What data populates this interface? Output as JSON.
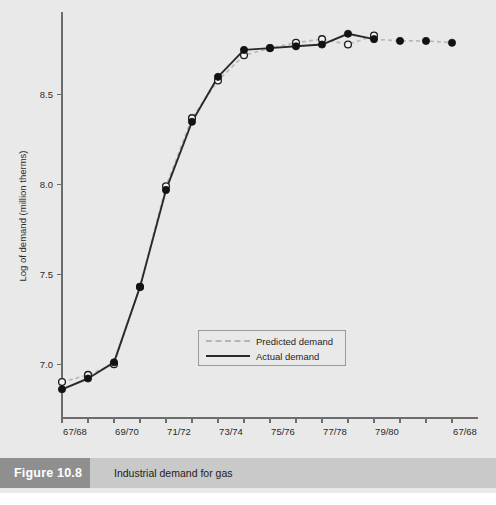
{
  "figure": {
    "number_label": "Figure 10.8",
    "caption": "Industrial demand for gas",
    "source_note": ""
  },
  "chart_data": {
    "type": "line",
    "title": "Industrial demand for gas",
    "xlabel": "",
    "ylabel": "Log of demand (million therms)",
    "grid": false,
    "legend_position": "inside-bottom-center",
    "xlim": [
      0,
      16
    ],
    "ylim": [
      6.7,
      8.95
    ],
    "y_ticks": [
      7.0,
      7.5,
      8.0,
      8.5
    ],
    "y_tick_labels": [
      "7.0",
      "7.5",
      "8.0",
      "8.5"
    ],
    "x_tick_positions": [
      0,
      1,
      2,
      3,
      4,
      5,
      6,
      7,
      8,
      9,
      10,
      11,
      12,
      13,
      14,
      15
    ],
    "x_tick_labels": [
      "67/68",
      "",
      "69/70",
      "",
      "71/72",
      "",
      "73/74",
      "",
      "75/76",
      "",
      "77/78",
      "",
      "79/80",
      "",
      "",
      "67/68"
    ],
    "x_labeled_ticks": [
      {
        "index": 0,
        "label": "67/68"
      },
      {
        "index": 2,
        "label": "69/70"
      },
      {
        "index": 4,
        "label": "71/72"
      },
      {
        "index": 6,
        "label": "73/74"
      },
      {
        "index": 8,
        "label": "75/76"
      },
      {
        "index": 10,
        "label": "77/78"
      },
      {
        "index": 12,
        "label": "79/80"
      },
      {
        "index": 15,
        "label": "67/68"
      }
    ],
    "series": [
      {
        "name": "Predicted demand",
        "style": "dashed",
        "color": "#b9b9b9",
        "marker": "open-circle",
        "x": [
          0,
          1,
          2,
          3,
          4,
          5,
          6,
          7,
          8,
          9,
          10,
          11,
          12
        ],
        "values": [
          6.9,
          6.94,
          7.0,
          7.43,
          7.99,
          8.37,
          8.58,
          8.72,
          8.76,
          8.79,
          8.81,
          8.78,
          8.83
        ]
      },
      {
        "name": "Actual demand",
        "style": "solid",
        "color": "#2a2a2a",
        "marker": "filled-circle",
        "x": [
          0,
          1,
          2,
          3,
          4,
          5,
          6,
          7,
          8,
          9,
          10,
          11,
          12
        ],
        "values": [
          6.86,
          6.92,
          7.01,
          7.43,
          7.97,
          8.35,
          8.6,
          8.75,
          8.76,
          8.77,
          8.78,
          8.84,
          8.81
        ]
      },
      {
        "name": "Predicted demand (forecast)",
        "style": "dashed",
        "color": "#b9b9b9",
        "marker": "filled-circle",
        "x": [
          12,
          13,
          14,
          15
        ],
        "values": [
          8.81,
          8.8,
          8.8,
          8.79
        ]
      }
    ],
    "legend": [
      {
        "label": "Predicted demand",
        "style": "dashed",
        "color": "#b9b9b9"
      },
      {
        "label": "Actual demand",
        "style": "solid",
        "color": "#2a2a2a"
      }
    ]
  },
  "colors": {
    "background": "#e9e9e9",
    "actual": "#2a2a2a",
    "predicted": "#b9b9b9",
    "axis": "#6d6d6d",
    "caption_bar": "#c9c9c9",
    "caption_number_bg": "#8f8f8f"
  }
}
